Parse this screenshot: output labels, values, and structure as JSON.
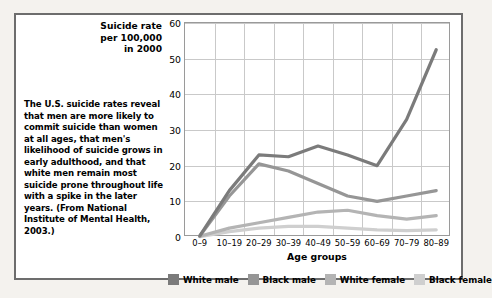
{
  "caption": "The U.S. suicide rates reveal that men are more likely to commit suicide than women at all ages, that men's likelihood of suicide grows in early adulthood, and that white men remain most suicide prone throughout life with a spike in the later years. (From National Institute of Mental Health, 2003.)",
  "y_axis_title": "Suicide rate\nper 100,000\nin 2000",
  "colors": {
    "white_male": "#7b7b7b",
    "black_male": "#969696",
    "white_female": "#b4b4b4",
    "black_female": "#cfcfcf",
    "gridline": "#c9c9c9",
    "frame": "#6d6d6d",
    "plot_border": "#9a9a9a"
  },
  "chart_data": {
    "type": "line",
    "title": "",
    "xlabel": "Age groups",
    "ylabel": "Suicide rate per 100,000 in 2000",
    "categories": [
      "0–9",
      "10–19",
      "20–29",
      "30–39",
      "40–49",
      "50–59",
      "60–69",
      "70–79",
      "80–89"
    ],
    "ylim": [
      0,
      60
    ],
    "yticks": [
      0,
      10,
      20,
      30,
      40,
      50,
      60
    ],
    "grid": true,
    "legend_position": "bottom",
    "series": [
      {
        "name": "White male",
        "values": [
          0.3,
          13.0,
          23.0,
          22.5,
          25.5,
          23.0,
          20.0,
          33.0,
          52.5
        ]
      },
      {
        "name": "Black male",
        "values": [
          0.3,
          11.5,
          20.5,
          18.5,
          15.0,
          11.5,
          10.0,
          11.5,
          13.0
        ]
      },
      {
        "name": "White female",
        "values": [
          0.2,
          2.5,
          4.0,
          5.5,
          7.0,
          7.5,
          6.0,
          5.0,
          6.0
        ]
      },
      {
        "name": "Black female",
        "values": [
          0.1,
          1.5,
          2.5,
          3.0,
          3.0,
          2.5,
          2.0,
          1.8,
          2.0
        ]
      }
    ]
  }
}
